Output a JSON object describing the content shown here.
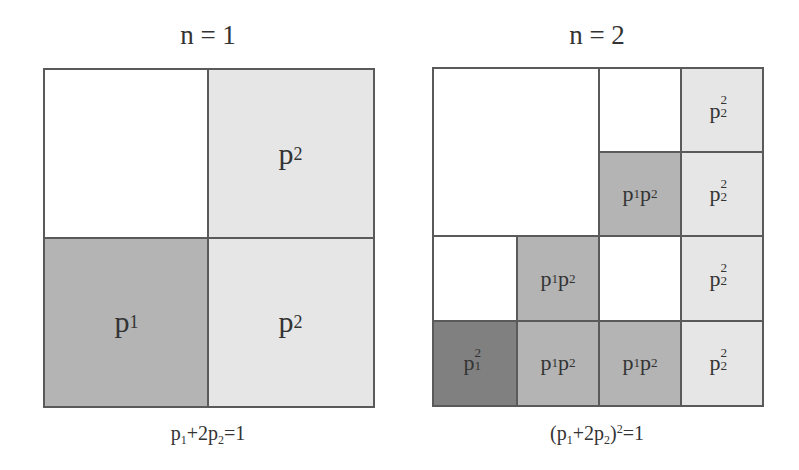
{
  "panels": [
    {
      "title": "n = 1",
      "caption": "p₁+2p₂=1",
      "grid": "2x2",
      "cells": [
        {
          "row": 0,
          "col": 0,
          "label": "",
          "shade": "white"
        },
        {
          "row": 0,
          "col": 1,
          "label": "p2",
          "shade": "light"
        },
        {
          "row": 1,
          "col": 0,
          "label": "p1",
          "shade": "medium"
        },
        {
          "row": 1,
          "col": 1,
          "label": "p2",
          "shade": "light"
        }
      ]
    },
    {
      "title": "n = 2",
      "caption": "(p₁+2p₂)²=1",
      "grid": "4x4",
      "cells": [
        {
          "row": 0,
          "col": 0,
          "rowspan": 2,
          "colspan": 2,
          "label": "",
          "shade": "white"
        },
        {
          "row": 0,
          "col": 2,
          "label": "",
          "shade": "white"
        },
        {
          "row": 0,
          "col": 3,
          "label": "p2^2",
          "shade": "light"
        },
        {
          "row": 1,
          "col": 2,
          "label": "p1p2",
          "shade": "medium"
        },
        {
          "row": 1,
          "col": 3,
          "label": "p2^2",
          "shade": "light"
        },
        {
          "row": 2,
          "col": 0,
          "label": "",
          "shade": "white"
        },
        {
          "row": 2,
          "col": 1,
          "label": "p1p2",
          "shade": "medium"
        },
        {
          "row": 2,
          "col": 2,
          "label": "",
          "shade": "white"
        },
        {
          "row": 2,
          "col": 3,
          "label": "p2^2",
          "shade": "light"
        },
        {
          "row": 3,
          "col": 0,
          "label": "p1^2",
          "shade": "dark"
        },
        {
          "row": 3,
          "col": 1,
          "label": "p1p2",
          "shade": "medium"
        },
        {
          "row": 3,
          "col": 2,
          "label": "p1p2",
          "shade": "medium"
        },
        {
          "row": 3,
          "col": 3,
          "label": "p2^2",
          "shade": "light"
        }
      ]
    }
  ],
  "colors": {
    "white": "#ffffff",
    "light": "#e6e6e6",
    "medium": "#b4b4b4",
    "dark": "#808080",
    "border": "#5a5a5a"
  }
}
